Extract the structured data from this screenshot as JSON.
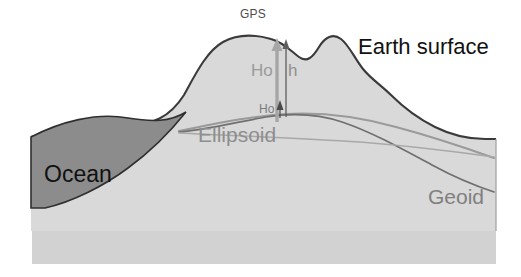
{
  "figure": {
    "background_color": "#ffffff",
    "width": 521,
    "height": 277
  },
  "colors": {
    "land_fill": "#d9d9d9",
    "land_fill_lower": "#d5d5d5",
    "ocean_fill": "#8c8c8c",
    "surface_outline": "#3a3a3a",
    "ocean_outline": "#2f2f2f",
    "ellipsoid_line": "#9a9a9a",
    "geoid_line": "#6f6f6f",
    "arrow_gray": "#a6a6a6",
    "arrow_dark": "#555555",
    "label_black": "#111111",
    "label_gray": "#8e8e8e"
  },
  "labels": {
    "gps": "GPS",
    "earth_surface": "Earth surface",
    "height_ellipsoidal_upper": "Ho",
    "height_h": "h",
    "height_orthometric": "Ho",
    "ellipsoid": "Ellipsoid",
    "ocean": "Ocean",
    "geoid": "Geoid"
  },
  "features": {
    "surfaces": [
      {
        "name": "earth-surface",
        "style": "dark outline, light gray fill",
        "label": "Earth surface"
      },
      {
        "name": "ellipsoid",
        "style": "light gray smooth curve",
        "label": "Ellipsoid"
      },
      {
        "name": "geoid",
        "style": "mid gray undulating curve",
        "label": "Geoid"
      },
      {
        "name": "ocean",
        "style": "dark gray filled lens region",
        "label": "Ocean"
      }
    ],
    "arrows": [
      {
        "name": "ellipsoidal-height-arrow",
        "color": "#a6a6a6",
        "direction": "up",
        "from": "ellipsoid",
        "to": "gps-point"
      },
      {
        "name": "orthometric-height-arrow",
        "color": "#555555",
        "direction": "up",
        "from": "geoid",
        "to": "gps-point"
      }
    ],
    "points": [
      {
        "name": "gps-point",
        "label": "GPS",
        "x": 278,
        "y": 40
      }
    ]
  }
}
